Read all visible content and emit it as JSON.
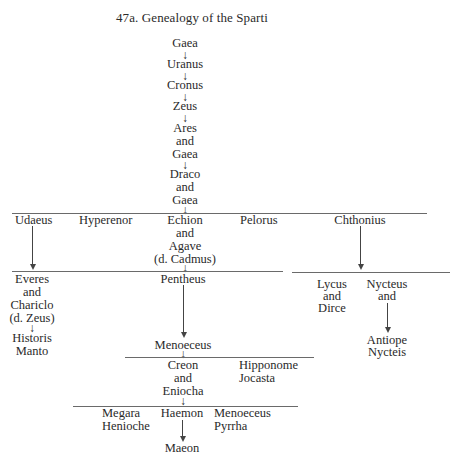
{
  "figure": {
    "number": "47a.",
    "title": "Genealogy of the Sparti",
    "corner_mark": "()"
  },
  "trunk": [
    "Gaea",
    "Uranus",
    "Cronus",
    "Zeus",
    "Ares",
    "and",
    "Gaea",
    "Draco",
    "and",
    "Gaea"
  ],
  "gen1": {
    "udaeus": "Udaeus",
    "hyperenor": "Hyperenor",
    "echion": [
      "Echion",
      "and",
      "Agave",
      "(d. Cadmus)"
    ],
    "pelorus": "Pelorus",
    "chthonius": "Chthonius"
  },
  "gen2": {
    "everes": [
      "Everes",
      "and",
      "Chariclo",
      "(d. Zeus)"
    ],
    "historis": [
      "Historis",
      "Manto"
    ],
    "pentheus": "Pentheus",
    "menoeceus": "Menoeceus",
    "lycus": [
      "Lycus",
      "and",
      "Dirce"
    ],
    "nycteus": [
      "Nycteus",
      "and"
    ],
    "antiope": [
      "Antiope",
      "Nycteis"
    ]
  },
  "gen3": {
    "creon": [
      "Creon",
      "and",
      "Eniocha"
    ],
    "hipponome": [
      "Hipponome",
      "Jocasta"
    ]
  },
  "gen4": {
    "megara": [
      "Megara",
      "Henioche"
    ],
    "haemon": "Haemon",
    "menoeceus": [
      "Menoeceus",
      "Pyrrha"
    ],
    "maeon": "Maeon"
  },
  "arrow_glyph": "↓"
}
